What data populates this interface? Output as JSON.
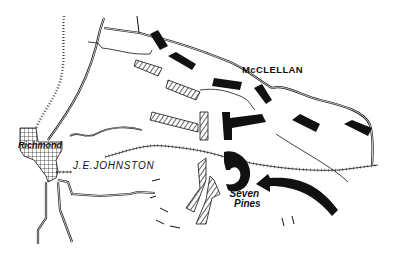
{
  "map": {
    "subject": "Battle of Seven Pines",
    "labels": {
      "union_commander": "McCLELLAN",
      "confederate_commander": "J.E.JOHNSTON",
      "city": "Richmond",
      "battle_site_line1": "Seven",
      "battle_site_line2": "Pines"
    },
    "legend_styles": {
      "union_units": "solid black bars",
      "confederate_units": "hatched bars",
      "railroads": "hatch-marked lines",
      "roads": "double lines",
      "streams": "thin single lines"
    },
    "colors": {
      "ink": "#111111",
      "background": "#ffffff"
    }
  }
}
